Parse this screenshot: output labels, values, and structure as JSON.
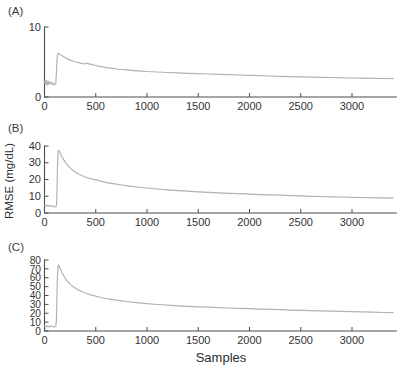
{
  "figure": {
    "panel_labels": [
      "(A)",
      "(B)",
      "(C)"
    ],
    "xlabel": "Samples",
    "ylabel": "RMSE (mg/dL)"
  },
  "colors": {
    "line": "#b2b2b2",
    "axis": "#4d4d4d",
    "text": "#333333",
    "background": "#ffffff"
  },
  "chart_data": [
    {
      "type": "line",
      "panel": "A",
      "title": "",
      "xlabel": "",
      "ylabel": "",
      "xlim": [
        0,
        3430
      ],
      "ylim": [
        0,
        10
      ],
      "yticks": [
        0,
        10
      ],
      "xticks": [
        0,
        500,
        1000,
        1500,
        2000,
        2500,
        3000
      ],
      "legend": "none",
      "grid": false,
      "points": [
        [
          0,
          2.2
        ],
        [
          10,
          1.8
        ],
        [
          18,
          2.4
        ],
        [
          26,
          1.7
        ],
        [
          34,
          2.3
        ],
        [
          42,
          1.8
        ],
        [
          50,
          2.2
        ],
        [
          58,
          1.9
        ],
        [
          66,
          2.1
        ],
        [
          75,
          1.8
        ],
        [
          85,
          2.0
        ],
        [
          95,
          1.7
        ],
        [
          103,
          1.8
        ],
        [
          110,
          2.0
        ],
        [
          116,
          3.5
        ],
        [
          122,
          5.3
        ],
        [
          128,
          6.1
        ],
        [
          135,
          6.25
        ],
        [
          145,
          6.1
        ],
        [
          158,
          6.0
        ],
        [
          172,
          5.9
        ],
        [
          188,
          5.75
        ],
        [
          205,
          5.6
        ],
        [
          225,
          5.45
        ],
        [
          245,
          5.3
        ],
        [
          265,
          5.2
        ],
        [
          285,
          5.1
        ],
        [
          305,
          5.0
        ],
        [
          335,
          4.9
        ],
        [
          365,
          4.8
        ],
        [
          395,
          4.72
        ],
        [
          415,
          4.82
        ],
        [
          435,
          4.75
        ],
        [
          465,
          4.62
        ],
        [
          500,
          4.5
        ],
        [
          540,
          4.38
        ],
        [
          580,
          4.27
        ],
        [
          620,
          4.17
        ],
        [
          660,
          4.08
        ],
        [
          700,
          4.0
        ],
        [
          750,
          3.93
        ],
        [
          800,
          3.87
        ],
        [
          850,
          3.8
        ],
        [
          900,
          3.75
        ],
        [
          950,
          3.7
        ],
        [
          1000,
          3.65
        ],
        [
          1100,
          3.57
        ],
        [
          1200,
          3.5
        ],
        [
          1300,
          3.44
        ],
        [
          1400,
          3.39
        ],
        [
          1500,
          3.34
        ],
        [
          1600,
          3.29
        ],
        [
          1700,
          3.24
        ],
        [
          1800,
          3.19
        ],
        [
          1900,
          3.14
        ],
        [
          2000,
          3.1
        ],
        [
          2100,
          3.05
        ],
        [
          2200,
          3.0
        ],
        [
          2300,
          2.96
        ],
        [
          2400,
          2.92
        ],
        [
          2500,
          2.88
        ],
        [
          2600,
          2.84
        ],
        [
          2700,
          2.81
        ],
        [
          2800,
          2.78
        ],
        [
          2900,
          2.75
        ],
        [
          3000,
          2.72
        ],
        [
          3100,
          2.69
        ],
        [
          3200,
          2.66
        ],
        [
          3300,
          2.64
        ],
        [
          3400,
          2.62
        ]
      ]
    },
    {
      "type": "line",
      "panel": "B",
      "title": "",
      "xlabel": "",
      "ylabel": "RMSE (mg/dL)",
      "xlim": [
        0,
        3430
      ],
      "ylim": [
        0,
        40
      ],
      "yticks": [
        0,
        10,
        20,
        30,
        40
      ],
      "xticks": [
        0,
        500,
        1000,
        1500,
        2000,
        2500,
        3000
      ],
      "legend": "none",
      "grid": false,
      "points": [
        [
          0,
          4.6
        ],
        [
          12,
          4.1
        ],
        [
          24,
          4.7
        ],
        [
          36,
          4.0
        ],
        [
          48,
          4.5
        ],
        [
          60,
          4.1
        ],
        [
          72,
          4.4
        ],
        [
          84,
          3.9
        ],
        [
          94,
          3.6
        ],
        [
          104,
          3.9
        ],
        [
          112,
          3.7
        ],
        [
          118,
          5.5
        ],
        [
          123,
          15
        ],
        [
          128,
          30
        ],
        [
          133,
          36.8
        ],
        [
          140,
          37.3
        ],
        [
          148,
          36.5
        ],
        [
          158,
          35.2
        ],
        [
          170,
          33.6
        ],
        [
          185,
          32.0
        ],
        [
          200,
          30.5
        ],
        [
          220,
          28.9
        ],
        [
          240,
          27.5
        ],
        [
          260,
          26.3
        ],
        [
          280,
          25.3
        ],
        [
          300,
          24.4
        ],
        [
          330,
          23.3
        ],
        [
          360,
          22.5
        ],
        [
          390,
          21.7
        ],
        [
          420,
          21.1
        ],
        [
          450,
          20.5
        ],
        [
          500,
          19.8
        ],
        [
          550,
          19.0
        ],
        [
          600,
          18.3
        ],
        [
          650,
          17.7
        ],
        [
          700,
          17.2
        ],
        [
          750,
          16.7
        ],
        [
          800,
          16.3
        ],
        [
          850,
          15.9
        ],
        [
          900,
          15.5
        ],
        [
          950,
          15.2
        ],
        [
          1000,
          14.9
        ],
        [
          1100,
          14.3
        ],
        [
          1200,
          13.8
        ],
        [
          1300,
          13.4
        ],
        [
          1400,
          13.0
        ],
        [
          1500,
          12.6
        ],
        [
          1600,
          12.3
        ],
        [
          1700,
          12.0
        ],
        [
          1800,
          11.7
        ],
        [
          1900,
          11.5
        ],
        [
          2000,
          11.2
        ],
        [
          2100,
          11.0
        ],
        [
          2200,
          10.8
        ],
        [
          2300,
          10.6
        ],
        [
          2400,
          10.4
        ],
        [
          2500,
          10.2
        ],
        [
          2600,
          10.0
        ],
        [
          2700,
          9.85
        ],
        [
          2800,
          9.7
        ],
        [
          2900,
          9.55
        ],
        [
          3000,
          9.4
        ],
        [
          3100,
          9.25
        ],
        [
          3200,
          9.1
        ],
        [
          3300,
          9.0
        ],
        [
          3400,
          8.9
        ]
      ]
    },
    {
      "type": "line",
      "panel": "C",
      "title": "",
      "xlabel": "Samples",
      "ylabel": "",
      "xlim": [
        0,
        3430
      ],
      "ylim": [
        0,
        80
      ],
      "yticks": [
        0,
        10,
        20,
        30,
        40,
        50,
        60,
        70,
        80
      ],
      "xticks": [
        0,
        500,
        1000,
        1500,
        2000,
        2500,
        3000
      ],
      "legend": "none",
      "grid": false,
      "points": [
        [
          0,
          5.5
        ],
        [
          12,
          4.8
        ],
        [
          24,
          6.0
        ],
        [
          36,
          4.6
        ],
        [
          48,
          5.8
        ],
        [
          60,
          4.9
        ],
        [
          72,
          5.6
        ],
        [
          84,
          4.7
        ],
        [
          94,
          4.4
        ],
        [
          104,
          4.9
        ],
        [
          110,
          5.5
        ],
        [
          116,
          12
        ],
        [
          121,
          35
        ],
        [
          126,
          60
        ],
        [
          131,
          72
        ],
        [
          136,
          74.5
        ],
        [
          143,
          73
        ],
        [
          152,
          70.5
        ],
        [
          162,
          68
        ],
        [
          175,
          64.8
        ],
        [
          190,
          61.5
        ],
        [
          210,
          58
        ],
        [
          230,
          55.2
        ],
        [
          250,
          52.8
        ],
        [
          270,
          50.8
        ],
        [
          290,
          49.2
        ],
        [
          310,
          47.7
        ],
        [
          340,
          45.8
        ],
        [
          370,
          44.2
        ],
        [
          400,
          42.8
        ],
        [
          430,
          41.6
        ],
        [
          460,
          40.5
        ],
        [
          500,
          39.2
        ],
        [
          550,
          37.8
        ],
        [
          600,
          36.6
        ],
        [
          650,
          35.6
        ],
        [
          700,
          34.7
        ],
        [
          750,
          33.9
        ],
        [
          800,
          33.2
        ],
        [
          850,
          32.5
        ],
        [
          900,
          31.9
        ],
        [
          950,
          31.4
        ],
        [
          1000,
          30.9
        ],
        [
          1100,
          29.9
        ],
        [
          1200,
          29.1
        ],
        [
          1300,
          28.4
        ],
        [
          1400,
          27.8
        ],
        [
          1500,
          27.3
        ],
        [
          1600,
          26.8
        ],
        [
          1700,
          26.3
        ],
        [
          1800,
          25.9
        ],
        [
          1900,
          25.5
        ],
        [
          2000,
          25.1
        ],
        [
          2100,
          24.7
        ],
        [
          2200,
          24.3
        ],
        [
          2300,
          24.0
        ],
        [
          2400,
          23.6
        ],
        [
          2500,
          23.3
        ],
        [
          2600,
          23.0
        ],
        [
          2700,
          22.7
        ],
        [
          2800,
          22.4
        ],
        [
          2900,
          22.1
        ],
        [
          3000,
          21.8
        ],
        [
          3100,
          21.5
        ],
        [
          3200,
          21.2
        ],
        [
          3300,
          20.9
        ],
        [
          3400,
          20.6
        ]
      ]
    }
  ]
}
